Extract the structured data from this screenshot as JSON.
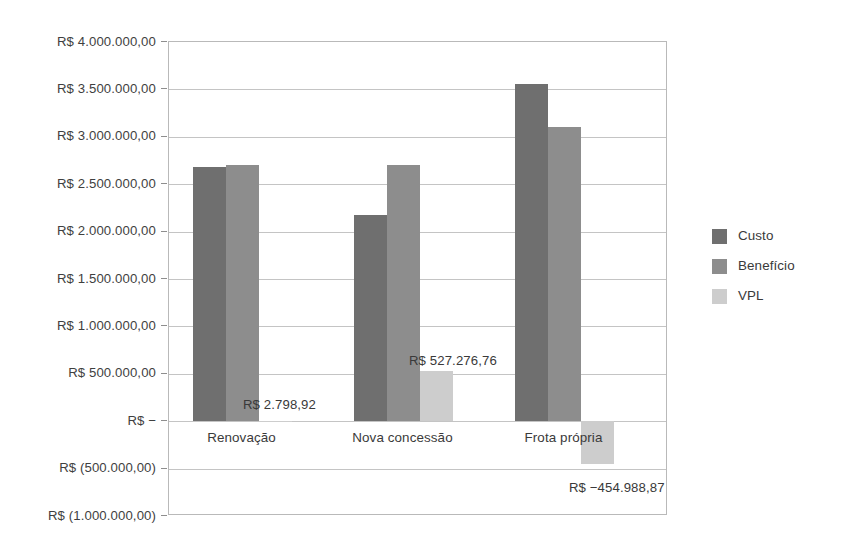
{
  "chart_data": {
    "type": "bar",
    "title": "",
    "subtitle": "",
    "xlabel": "",
    "ylabel": "",
    "grid": true,
    "legend_position": "right",
    "categories": [
      "Renovação",
      "Nova concessão",
      "Frota própria"
    ],
    "series": [
      {
        "name": "Custo",
        "color": "#6f6f6f",
        "values": [
          2680000,
          2175000,
          3555000
        ]
      },
      {
        "name": "Benefício",
        "color": "#8d8d8d",
        "values": [
          2705000,
          2700000,
          3105000
        ]
      },
      {
        "name": "VPL",
        "color": "#cdcdcd",
        "values": [
          2798.92,
          527276.76,
          -454988.87
        ]
      }
    ],
    "ylim": [
      -1000000,
      4000000
    ],
    "ytick_values": [
      4000000,
      3500000,
      3000000,
      2500000,
      2000000,
      1500000,
      1000000,
      500000,
      0,
      -500000,
      -1000000
    ],
    "ytick_labels": [
      "R$ 4.000.000,00",
      "R$ 3.500.000,00",
      "R$ 3.000.000,00",
      "R$ 2.500.000,00",
      "R$ 2.000.000,00",
      "R$ 1.500.000,00",
      "R$ 1.000.000,00",
      "R$ 500.000,00",
      "R$ −",
      "R$ (500.000,00)",
      "R$ (1.000.000,00)"
    ],
    "data_labels": [
      {
        "text": "R$ 2.798,92",
        "series": "VPL",
        "category": "Renovação"
      },
      {
        "text": "R$ 527.276,76",
        "series": "VPL",
        "category": "Nova concessão"
      },
      {
        "text": "R$ −454.988,87",
        "series": "VPL",
        "category": "Frota própria"
      }
    ]
  },
  "legend": {
    "items": [
      {
        "label": "Custo",
        "color": "#6f6f6f"
      },
      {
        "label": "Benefício",
        "color": "#8d8d8d"
      },
      {
        "label": "VPL",
        "color": "#cdcdcd"
      }
    ]
  },
  "colors": {
    "custo": "#6f6f6f",
    "beneficio": "#8d8d8d",
    "vpl": "#cdcdcd",
    "gridline": "#c4c4c4",
    "axis": "#b9b9b9",
    "text": "#3a3a3a",
    "background": "#ffffff"
  }
}
